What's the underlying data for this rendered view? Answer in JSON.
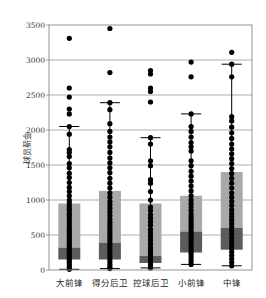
{
  "chart_data": {
    "type": "box",
    "title": "",
    "xlabel": "",
    "ylabel": "球员薪金",
    "ylim": [
      0,
      3500
    ],
    "yticks": [
      0,
      500,
      1000,
      1500,
      2000,
      2500,
      3000,
      3500
    ],
    "grid": "horizontal",
    "categories": [
      "大前锋",
      "得分后卫",
      "控球后卫",
      "小前锋",
      "中锋"
    ],
    "boxes": [
      {
        "name": "大前锋",
        "whisker_low": 10,
        "q1": 150,
        "median": 320,
        "q3": 950,
        "whisker_high": 2050,
        "outliers": [
          3310,
          2600,
          2470,
          2300,
          2230
        ],
        "points": [
          2050,
          1940,
          1720,
          1680,
          1620,
          1520,
          1460,
          1380,
          1320,
          1250,
          1180,
          1120,
          1060,
          1000,
          960,
          920,
          880,
          850,
          810,
          780,
          740,
          700,
          660,
          620,
          580,
          550,
          520,
          490,
          460,
          430,
          400,
          370,
          340,
          310,
          280,
          250,
          220,
          190,
          160,
          130,
          100,
          70,
          40,
          10
        ]
      },
      {
        "name": "得分后卫",
        "whisker_low": 20,
        "q1": 150,
        "median": 390,
        "q3": 1130,
        "whisker_high": 2390,
        "outliers": [
          3450,
          2820
        ],
        "points": [
          2390,
          2290,
          2090,
          1980,
          1900,
          1830,
          1760,
          1680,
          1600,
          1530,
          1460,
          1390,
          1310,
          1240,
          1170,
          1100,
          1040,
          980,
          930,
          880,
          830,
          780,
          730,
          680,
          640,
          600,
          560,
          520,
          480,
          440,
          400,
          360,
          320,
          280,
          240,
          200,
          160,
          120,
          80,
          40,
          20
        ]
      },
      {
        "name": "控球后卫",
        "whisker_low": 30,
        "q1": 100,
        "median": 200,
        "q3": 950,
        "whisker_high": 1890,
        "outliers": [
          2850,
          2800,
          2600,
          2550,
          2400
        ],
        "points": [
          1890,
          1800,
          1560,
          1490,
          1290,
          1240,
          1120,
          1000,
          900,
          850,
          790,
          740,
          690,
          640,
          580,
          530,
          480,
          430,
          380,
          330,
          290,
          250,
          210,
          170,
          130,
          90,
          60,
          30
        ]
      },
      {
        "name": "小前锋",
        "whisker_low": 80,
        "q1": 250,
        "median": 550,
        "q3": 1060,
        "whisker_high": 2230,
        "outliers": [
          2970,
          2760
        ],
        "points": [
          2230,
          2050,
          1980,
          1900,
          1820,
          1760,
          1700,
          1560,
          1490,
          1410,
          1340,
          1270,
          1200,
          1130,
          1060,
          1000,
          950,
          900,
          850,
          800,
          760,
          720,
          680,
          640,
          600,
          560,
          520,
          480,
          440,
          400,
          360,
          320,
          280,
          240,
          200,
          160,
          120,
          80
        ]
      },
      {
        "name": "中锋",
        "whisker_low": 60,
        "q1": 290,
        "median": 600,
        "q3": 1400,
        "whisker_high": 2940,
        "outliers": [
          3110
        ],
        "points": [
          2940,
          2760,
          2190,
          2130,
          2040,
          1960,
          1880,
          1800,
          1730,
          1660,
          1590,
          1520,
          1450,
          1380,
          1310,
          1240,
          1170,
          1100,
          1040,
          980,
          920,
          860,
          810,
          760,
          710,
          660,
          610,
          560,
          510,
          460,
          410,
          360,
          310,
          260,
          210,
          160,
          110,
          60
        ]
      }
    ],
    "colors": {
      "box_upper": "#a9a9a9",
      "box_lower": "#5c5c5c",
      "points": "#000000",
      "grid": "#9a9a9a",
      "axis": "#888888"
    }
  }
}
